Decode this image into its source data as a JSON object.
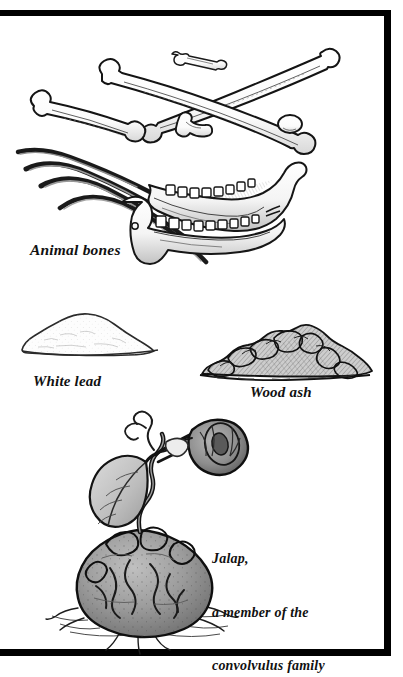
{
  "page": {
    "kind": "book-plate-illustration",
    "background_color": "#ffffff",
    "ink_color": "#111111",
    "frame": {
      "color": "#000000",
      "style": "thick-rule-border",
      "sides_visible": [
        "top",
        "right",
        "bottom"
      ],
      "left_edge": "cropped"
    }
  },
  "captions": {
    "animal_bones": "Animal bones",
    "white_lead": "White lead",
    "wood_ash": "Wood ash",
    "jalap_line1": "Jalap,",
    "jalap_line2": "a member of the",
    "jalap_line3": "convolvulus family"
  },
  "illustrations": [
    {
      "id": "animal-bones",
      "label": "Animal bones",
      "technique": "pen-and-ink hatching",
      "parts": [
        "small-bone",
        "long-femur-upper",
        "long-femur-crossing",
        "short-femur-left",
        "small-vertebra-fragment",
        "rib-1",
        "rib-2",
        "rib-3",
        "rib-4",
        "mandible-upper",
        "mandible-lower"
      ]
    },
    {
      "id": "white-lead",
      "label": "White lead",
      "technique": "outline with faint stipple",
      "fill_color": "#fdfdfd",
      "shape": "low-mound-of-powder"
    },
    {
      "id": "wood-ash",
      "label": "Wood ash",
      "technique": "dense cross-hatching",
      "fill_color": "#b9b9b9",
      "shape": "heaped-mound-of-ash"
    },
    {
      "id": "jalap-plant",
      "label": "Jalap, a member of the convolvulus family",
      "technique": "ink line with grey wash",
      "parts": [
        "tuber-root",
        "soil-line",
        "rootlets",
        "twisting-stem",
        "heart-shaped-leaf",
        "trumpet-flower",
        "tendril",
        "bud"
      ],
      "tuber_color": "#9a9a9a",
      "flower_color": "#8c8c8c",
      "leaf_color": "#c9c9c9"
    }
  ]
}
